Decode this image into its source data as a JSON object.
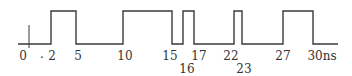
{
  "diagram": {
    "type": "timing-waveform",
    "unit": "ns",
    "line_color": "#3a3a3a",
    "levels": {
      "low_y": 44,
      "high_y": 11
    },
    "baseline": {
      "x_start": 18,
      "x_end": 338
    },
    "origin_tick": {
      "x": 29,
      "y_top": 25,
      "y_bottom": 48
    },
    "pulses": [
      {
        "rise": 2,
        "fall": 5,
        "x_rise": 51,
        "x_fall": 76
      },
      {
        "rise": 10,
        "fall": 15,
        "x_rise": 123,
        "x_fall": 172
      },
      {
        "rise": 16,
        "fall": 17,
        "x_rise": 183,
        "x_fall": 194
      },
      {
        "rise": 22,
        "fall": 23,
        "x_rise": 234,
        "x_fall": 242
      },
      {
        "rise": 27,
        "fall": 30,
        "x_rise": 283,
        "x_fall": 313
      }
    ],
    "labels": [
      {
        "text": "0",
        "x": 23,
        "y": 50
      },
      {
        "text": ".",
        "x": 42,
        "y": 48
      },
      {
        "text": "2",
        "x": 52,
        "y": 50
      },
      {
        "text": "5",
        "x": 78,
        "y": 50
      },
      {
        "text": "10",
        "x": 125,
        "y": 50
      },
      {
        "text": "15",
        "x": 170,
        "y": 50
      },
      {
        "text": "16",
        "x": 187,
        "y": 63
      },
      {
        "text": "17",
        "x": 199,
        "y": 50
      },
      {
        "text": "22",
        "x": 231,
        "y": 50
      },
      {
        "text": "23",
        "x": 244,
        "y": 63
      },
      {
        "text": "27",
        "x": 283,
        "y": 50
      },
      {
        "text": "30ns",
        "x": 322,
        "y": 50
      }
    ]
  }
}
